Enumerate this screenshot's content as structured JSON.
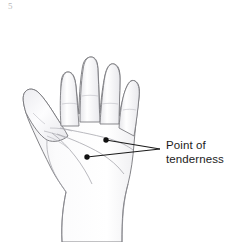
{
  "figure": {
    "background_color": "#ffffff",
    "width": 227,
    "height": 242,
    "corner_mark": "5"
  },
  "illustration": {
    "subject": "left-hand-palm",
    "view": "palmar",
    "fill_color": "#fdfdfd",
    "outline_color": "#6e6e72",
    "crease_color": "#9a9a9e",
    "shading_color": "#e9e9ec",
    "fingers": [
      {
        "name": "index-finger",
        "tip_y": 22
      },
      {
        "name": "middle-finger",
        "tip_y": 10
      },
      {
        "name": "ring-finger",
        "tip_y": 27
      },
      {
        "name": "little-finger",
        "tip_y": 55
      },
      {
        "name": "thumb",
        "tip_y": 95
      }
    ]
  },
  "callout": {
    "label_line_1": "Point of",
    "label_line_2": "tenderness",
    "text_color": "#1c1c1c",
    "leader_color": "#1a1a1a",
    "vertex": {
      "x": 160,
      "y": 149
    },
    "markers": [
      {
        "name": "tenderness-marker-upper",
        "x": 106,
        "y": 140,
        "radius": 2.6
      },
      {
        "name": "tenderness-marker-lower",
        "x": 87,
        "y": 157,
        "radius": 2.6
      }
    ]
  }
}
